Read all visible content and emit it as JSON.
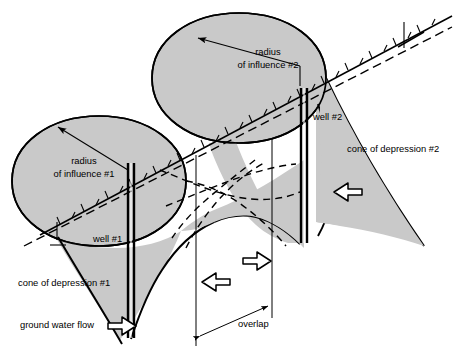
{
  "figure": {
    "width": 456,
    "height": 349,
    "background_color": "#ffffff",
    "cone_fill_color": "#c9c9c9",
    "line_color": "#000000"
  },
  "labels": {
    "radius_of_influence_1_line1": "radius",
    "radius_of_influence_1_line2": "of influence #1",
    "radius_of_influence_2_line1": "radius",
    "radius_of_influence_2_line2": "of influence #2",
    "well_1": "well #1",
    "well_2": "well #2",
    "cone_of_depression_1": "cone of depression #1",
    "cone_of_depression_2": "cone of depression #2",
    "ground_water_flow": "ground water flow",
    "overlap": "overlap"
  },
  "annotations": {
    "flow_arrow_direction": "right",
    "overlap_arrow_upper_direction": "right",
    "overlap_arrow_lower_direction": "left",
    "right_flow_arrow_direction": "left",
    "overlap_measure_arrow": "double-headed"
  },
  "icons": {
    "ground_water_flow_arrow": "block-arrow-right-icon",
    "overlap_arrow_upper": "block-arrow-right-icon",
    "overlap_arrow_lower": "block-arrow-left-icon",
    "right_flow_arrow": "block-arrow-left-icon"
  }
}
